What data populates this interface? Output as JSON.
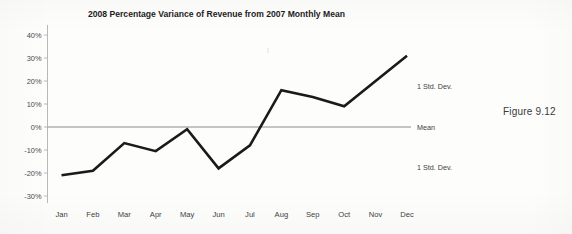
{
  "figure": {
    "caption": "Figure 9.12"
  },
  "chart_data": {
    "type": "line",
    "title": "2008 Percentage Variance of Revenue from 2007 Monthly Mean",
    "xlabel": "",
    "ylabel": "",
    "categories": [
      "Jan",
      "Feb",
      "Mar",
      "Apr",
      "May",
      "Jun",
      "Jul",
      "Aug",
      "Sep",
      "Oct",
      "Nov",
      "Dec"
    ],
    "values": [
      -21,
      -19,
      -7,
      -10.5,
      -1,
      -18,
      -8,
      16,
      13,
      9,
      20,
      31
    ],
    "series": [
      {
        "name": "2008 Percentage Variance",
        "values": [
          -21,
          -19,
          -7,
          -10.5,
          -1,
          -18,
          -8,
          16,
          13,
          9,
          20,
          31
        ],
        "color": "#1a1a1a"
      }
    ],
    "ylim": [
      -30,
      40
    ],
    "ytick_values": [
      40,
      30,
      20,
      10,
      0,
      -10,
      -20,
      -30
    ],
    "ytick_labels": [
      "40%",
      "30%",
      "20%",
      "10%",
      "0%",
      "-10%",
      "-20%",
      "-30%"
    ],
    "yunit": "percent",
    "grid": false,
    "legend_position": "none",
    "reference_lines": [
      {
        "label": "Mean",
        "value": 0,
        "color": "#8c8c8c"
      }
    ],
    "annotations": [
      {
        "label": "1 Std. Dev.",
        "value": 17.5
      },
      {
        "label": "Mean",
        "value": 0
      },
      {
        "label": "1 Std. Dev.",
        "value": -17.5
      }
    ]
  }
}
